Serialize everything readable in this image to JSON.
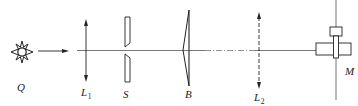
{
  "diagram": {
    "type": "optical-setup",
    "colors": {
      "stroke": "#222222",
      "axis": "#555555"
    },
    "components": [
      {
        "id": "Q",
        "label": "Q",
        "subscript": "",
        "kind": "light-source"
      },
      {
        "id": "L1",
        "label": "L",
        "subscript": "1",
        "kind": "convex-lens"
      },
      {
        "id": "S",
        "label": "S",
        "subscript": "",
        "kind": "slit"
      },
      {
        "id": "B",
        "label": "B",
        "subscript": "",
        "kind": "biprism"
      },
      {
        "id": "L2",
        "label": "L",
        "subscript": "2",
        "kind": "convex-lens-dashed"
      },
      {
        "id": "M",
        "label": "M",
        "subscript": "",
        "kind": "micrometer-eyepiece"
      }
    ]
  }
}
